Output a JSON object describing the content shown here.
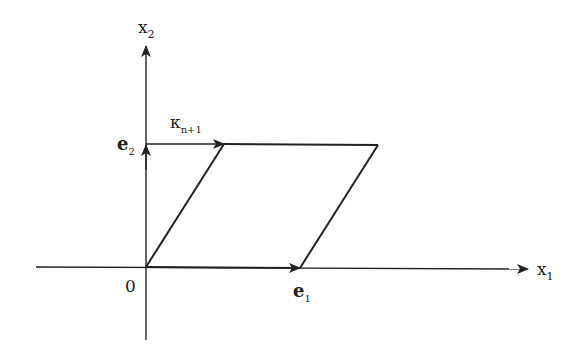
{
  "diagram": {
    "type": "parallelogram-lattice-cell",
    "axes": {
      "x_label": "x",
      "x_sub": "1",
      "y_label": "x",
      "y_sub": "2",
      "origin_label": "0"
    },
    "vectors": {
      "e1_label": "e",
      "e1_sub": "1",
      "e2_label": "e",
      "e2_sub": "2",
      "kappa_label": "κ",
      "kappa_sub": "n+1"
    },
    "colors": {
      "stroke": "#222222",
      "background": "#ffffff"
    }
  }
}
